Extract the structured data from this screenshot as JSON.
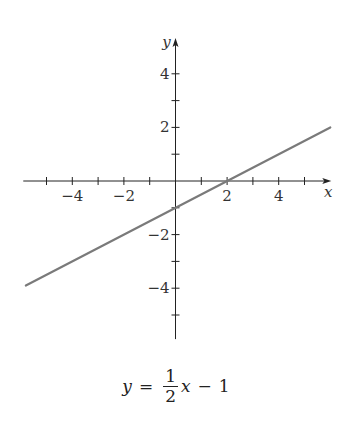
{
  "chart_data": {
    "type": "line",
    "title": "",
    "caption": {
      "lhs": "y",
      "equals": "=",
      "numerator": "1",
      "denominator": "2",
      "variable": "x",
      "minus": "−",
      "constant": "1",
      "text": "y = (1/2)x − 1"
    },
    "xlabel": "x",
    "ylabel": "y",
    "xlim": [
      -5.9,
      6.0
    ],
    "ylim": [
      -5.9,
      5.3
    ],
    "x_ticks": [
      -5,
      -4,
      -3,
      -2,
      -1,
      1,
      2,
      3,
      4,
      5
    ],
    "x_tick_labels": [
      {
        "value": -4,
        "label": "−4"
      },
      {
        "value": -2,
        "label": "−2"
      },
      {
        "value": 2,
        "label": "2"
      },
      {
        "value": 4,
        "label": "4"
      }
    ],
    "y_ticks": [
      -5,
      -4,
      -3,
      -2,
      -1,
      1,
      2,
      3,
      4
    ],
    "y_tick_labels": [
      {
        "value": 4,
        "label": "4"
      },
      {
        "value": 2,
        "label": "2"
      },
      {
        "value": -2,
        "label": "−2"
      },
      {
        "value": -4,
        "label": "−4"
      }
    ],
    "grid": false,
    "legend": null,
    "series": [
      {
        "name": "y = 1/2 x − 1",
        "slope": 0.5,
        "intercept": -1,
        "x": [
          -5.8,
          6
        ],
        "y": [
          -3.9,
          2
        ],
        "color": "#7a7a7a"
      }
    ],
    "annotations": {
      "x_intercept": [
        2,
        0
      ],
      "y_intercept": [
        0,
        -1
      ]
    }
  },
  "colors": {
    "axis": "#222222",
    "line": "#7a7a7a",
    "background": "#ffffff"
  }
}
